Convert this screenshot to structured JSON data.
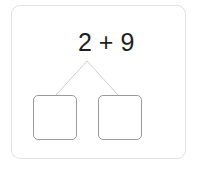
{
  "problem": {
    "expression": "2 + 9",
    "left_operand": "2",
    "operator": "+",
    "right_operand": "9",
    "split_target": "2"
  },
  "answer_boxes": [
    {
      "value": ""
    },
    {
      "value": ""
    }
  ],
  "colors": {
    "text": "#1e1e1e",
    "connector": "#cfcfcf",
    "box_border": "#9a9a9a",
    "card_border": "#e2e2e2"
  }
}
